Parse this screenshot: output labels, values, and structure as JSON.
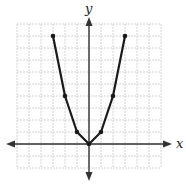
{
  "chart_data": {
    "type": "line",
    "title": "",
    "xlabel": "x",
    "ylabel": "y",
    "xlim": [
      -6,
      6
    ],
    "ylim": [
      -2,
      10
    ],
    "grid": true,
    "legend": null,
    "series": [
      {
        "name": "y = x^2",
        "x": [
          -3,
          -2,
          -1,
          0,
          1,
          2,
          3
        ],
        "y": [
          9,
          4,
          1,
          0,
          1,
          4,
          9
        ],
        "markers": true
      }
    ]
  },
  "colors": {
    "grid": "#c8c8c8",
    "axis": "#333333",
    "line": "#1a1a1a"
  }
}
